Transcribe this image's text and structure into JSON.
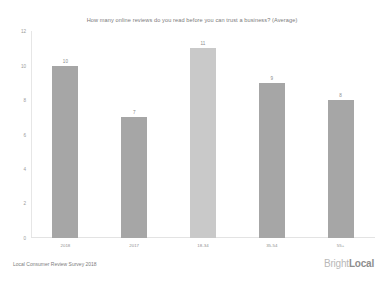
{
  "chart_data": {
    "type": "bar",
    "title": "How many online reviews do you read before you can trust a business? (Average)",
    "categories": [
      "2018",
      "2017",
      "18-34",
      "35-54",
      "55+"
    ],
    "values": [
      10,
      7,
      11,
      9,
      8
    ],
    "xlabel": "",
    "ylabel": "",
    "ylim": [
      0,
      12
    ],
    "yticks": [
      12,
      10,
      8,
      6,
      4,
      2,
      0
    ],
    "grid": false,
    "legend": "none",
    "bar_colors": [
      "#a6a6a6",
      "#a6a6a6",
      "#c9c9c9",
      "#a6a6a6",
      "#a6a6a6"
    ],
    "data_labels": [
      "10",
      "7",
      "11",
      "9",
      "8"
    ]
  },
  "footer": {
    "source_note": "Local Consumer Review Survey 2018",
    "logo_primary": "Bright",
    "logo_secondary": "Local"
  }
}
